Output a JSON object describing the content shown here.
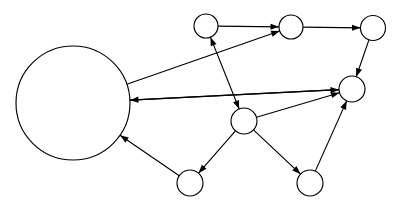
{
  "figure": {
    "background_color": "#ffffff",
    "stroke_color": "#000000",
    "node_fill_color": "#ffffff",
    "stroke_width": 1.15,
    "width": 408,
    "height": 209
  },
  "graph": {
    "type": "directed-graph",
    "node_count": 8,
    "edge_count": 12,
    "nodes": [
      {
        "id": "A",
        "label": "",
        "cx": 73,
        "cy": 103,
        "r": 57
      },
      {
        "id": "B",
        "label": "",
        "cx": 206,
        "cy": 26,
        "r": 12
      },
      {
        "id": "C",
        "label": "",
        "cx": 291,
        "cy": 27,
        "r": 12
      },
      {
        "id": "D",
        "label": "",
        "cx": 373,
        "cy": 28,
        "r": 12.5
      },
      {
        "id": "E",
        "label": "",
        "cx": 352,
        "cy": 89,
        "r": 13
      },
      {
        "id": "F",
        "label": "",
        "cx": 244,
        "cy": 121,
        "r": 13
      },
      {
        "id": "G",
        "label": "",
        "cx": 190,
        "cy": 183,
        "r": 13
      },
      {
        "id": "H",
        "label": "",
        "cx": 310,
        "cy": 183,
        "r": 13
      }
    ],
    "edges": [
      {
        "from": "B",
        "to": "C",
        "directed": true,
        "bidirectional": false
      },
      {
        "from": "C",
        "to": "D",
        "directed": true,
        "bidirectional": false
      },
      {
        "from": "D",
        "to": "E",
        "directed": true,
        "bidirectional": false
      },
      {
        "from": "A",
        "to": "C",
        "directed": true,
        "bidirectional": false
      },
      {
        "from": "A",
        "to": "E",
        "directed": true,
        "bidirectional": false
      },
      {
        "from": "E",
        "to": "A",
        "directed": true,
        "bidirectional": false
      },
      {
        "from": "F",
        "to": "B",
        "directed": true,
        "bidirectional": true
      },
      {
        "from": "F",
        "to": "E",
        "directed": true,
        "bidirectional": false
      },
      {
        "from": "F",
        "to": "G",
        "directed": true,
        "bidirectional": false
      },
      {
        "from": "F",
        "to": "H",
        "directed": true,
        "bidirectional": false
      },
      {
        "from": "H",
        "to": "E",
        "directed": true,
        "bidirectional": false
      },
      {
        "from": "G",
        "to": "A",
        "directed": true,
        "bidirectional": false
      }
    ]
  }
}
